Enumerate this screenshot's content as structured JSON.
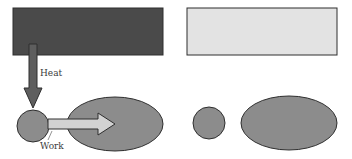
{
  "diagram": {
    "type": "heat-engine-schematic",
    "colors": {
      "hot_reservoir": "#4a4a4a",
      "cold_reservoir": "#e3e3e3",
      "body": "#8c8c8c",
      "heat_arrow": "#5e5e5e",
      "work_arrow": "#d2d2d2",
      "outline": "#2e2e2e",
      "label": "#3a3a3a"
    },
    "left_panel": {
      "hot_reservoir": {
        "x": 13,
        "y": 8,
        "width": 150,
        "height": 47
      },
      "heat_arrow": {
        "label": "Heat"
      },
      "engine_circle": {
        "cx": 33,
        "cy": 126,
        "r": 16
      },
      "work_arrow": {
        "label": "Work"
      },
      "target_ellipse": {
        "cx": 115,
        "cy": 124,
        "rx": 48,
        "ry": 27
      }
    },
    "right_panel": {
      "cold_reservoir": {
        "x": 187,
        "y": 8,
        "width": 150,
        "height": 47
      },
      "engine_circle": {
        "cx": 209,
        "cy": 123,
        "r": 16
      },
      "target_ellipse": {
        "cx": 289,
        "cy": 123,
        "rx": 48,
        "ry": 27
      }
    }
  }
}
